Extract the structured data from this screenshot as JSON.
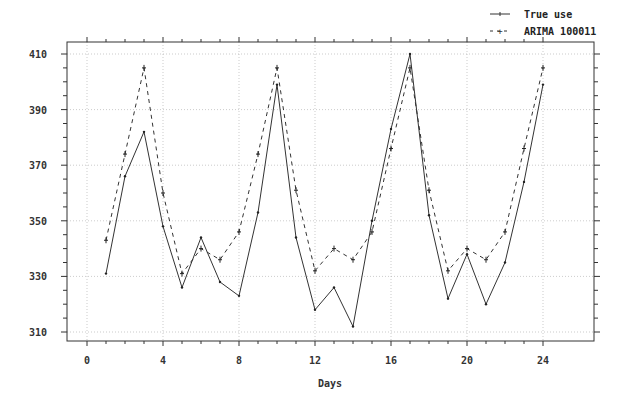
{
  "chart_data": {
    "type": "line",
    "title": "",
    "xlabel": "Days",
    "ylabel": "",
    "xlim": [
      -0.5,
      25
    ],
    "ylim": [
      306,
      414
    ],
    "x_ticks": [
      0,
      4,
      8,
      12,
      16,
      20,
      24
    ],
    "x_tick_labels": [
      "0",
      "4",
      "8",
      "12",
      "16",
      "20",
      "24"
    ],
    "y_ticks": [
      310,
      330,
      350,
      370,
      390,
      410
    ],
    "y_tick_labels": [
      "310",
      "330",
      "350",
      "370",
      "390",
      "410"
    ],
    "grid": true,
    "legend_position": "top-right, above plot",
    "x": [
      1,
      2,
      3,
      4,
      5,
      6,
      7,
      8,
      9,
      10,
      11,
      12,
      13,
      14,
      15,
      16,
      17,
      18,
      19,
      20,
      21,
      22,
      23,
      24
    ],
    "series": [
      {
        "name": "True use",
        "style": "solid",
        "marker": "dot",
        "values": [
          331,
          366,
          382,
          348,
          326,
          344,
          328,
          323,
          353,
          399,
          344,
          318,
          326,
          312,
          350,
          383,
          410,
          352,
          322,
          338,
          320,
          335,
          364,
          399
        ]
      },
      {
        "name": "ARIMA 100011",
        "style": "dashed",
        "marker": "plus",
        "values": [
          343,
          374,
          405,
          360,
          331,
          340,
          336,
          346,
          374,
          405,
          361,
          332,
          340,
          336,
          346,
          376,
          405,
          361,
          332,
          340,
          336,
          346,
          376,
          405
        ]
      }
    ]
  },
  "legend": {
    "items": [
      {
        "label": "True use"
      },
      {
        "label": "ARIMA 100011"
      }
    ]
  }
}
